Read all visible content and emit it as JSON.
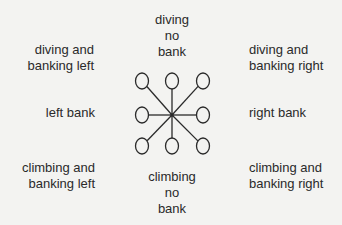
{
  "labels": {
    "top": [
      "diving",
      "no",
      "bank"
    ],
    "top_left": [
      "diving and",
      "banking left"
    ],
    "top_right": [
      "diving and",
      "banking right"
    ],
    "left": [
      "left bank"
    ],
    "right": [
      "right bank"
    ],
    "bottom_left": [
      "climbing and",
      "banking left"
    ],
    "bottom_right": [
      "climbing and",
      "banking right"
    ],
    "bottom": [
      "climbing",
      "no",
      "bank"
    ]
  },
  "diagram": {
    "hub": [
      172,
      115
    ],
    "nodes": [
      {
        "name": "diving-banking-left",
        "cx": 142,
        "cy": 81
      },
      {
        "name": "diving-no-bank",
        "cx": 172,
        "cy": 81
      },
      {
        "name": "diving-banking-right",
        "cx": 203,
        "cy": 81
      },
      {
        "name": "left-bank",
        "cx": 142,
        "cy": 115
      },
      {
        "name": "right-bank",
        "cx": 203,
        "cy": 115
      },
      {
        "name": "climbing-banking-left",
        "cx": 142,
        "cy": 146
      },
      {
        "name": "climbing-no-bank",
        "cx": 172,
        "cy": 146
      },
      {
        "name": "climbing-banking-right",
        "cx": 203,
        "cy": 146
      }
    ],
    "stroke_color": "#2a2a2a"
  }
}
